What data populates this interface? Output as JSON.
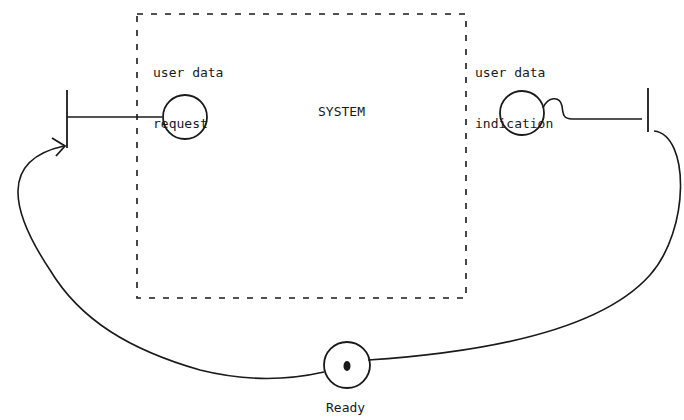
{
  "diagram": {
    "system": {
      "label": "SYSTEM"
    },
    "request": {
      "label_line1": "user data",
      "label_line2": "request"
    },
    "indication": {
      "label_line1": "user data",
      "label_line2": "indication"
    },
    "ready_place": {
      "label": "Ready"
    },
    "colors": {
      "ink": "#1a1a1a",
      "background": "#ffffff"
    }
  }
}
